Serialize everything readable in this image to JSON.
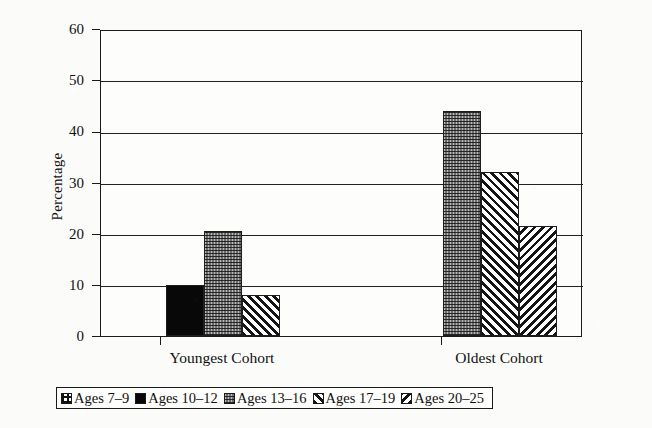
{
  "chart_data": {
    "type": "bar",
    "title": "",
    "xlabel": "",
    "ylabel": "Percentage",
    "ylim": [
      0,
      60
    ],
    "ytick_step": 10,
    "yticks": [
      "0",
      "10",
      "20",
      "30",
      "40",
      "50",
      "60"
    ],
    "grid": true,
    "legend_position": "bottom",
    "categories": [
      "Youngest Cohort",
      "Oldest Cohort"
    ],
    "series": [
      {
        "name": "Ages 7–9",
        "pattern": "grid",
        "values": [
          null,
          null
        ]
      },
      {
        "name": "Ages 10–12",
        "pattern": "solid",
        "values": [
          10,
          null
        ]
      },
      {
        "name": "Ages 13–16",
        "pattern": "stipple",
        "values": [
          20.5,
          44
        ]
      },
      {
        "name": "Ages 17–19",
        "pattern": "hatch-fwd",
        "values": [
          8,
          32
        ]
      },
      {
        "name": "Ages 20–25",
        "pattern": "hatch-back",
        "values": [
          null,
          21.5
        ]
      }
    ]
  },
  "axis": {
    "y_title": "Percentage"
  },
  "legend": {
    "entries": [
      {
        "label": "Ages 7–9",
        "pattern": "grid"
      },
      {
        "label": "Ages 10–12",
        "pattern": "solid"
      },
      {
        "label": "Ages 13–16",
        "pattern": "stipple"
      },
      {
        "label": "Ages 17–19",
        "pattern": "hatch-fwd"
      },
      {
        "label": "Ages 20–25",
        "pattern": "hatch-back"
      }
    ]
  },
  "colors": {
    "ink": "#111111",
    "paper": "#fbfbf9",
    "plot_background": "#fdfdfb",
    "solid_fill": "#080808",
    "stipple_fill": "#6e6e6e"
  }
}
